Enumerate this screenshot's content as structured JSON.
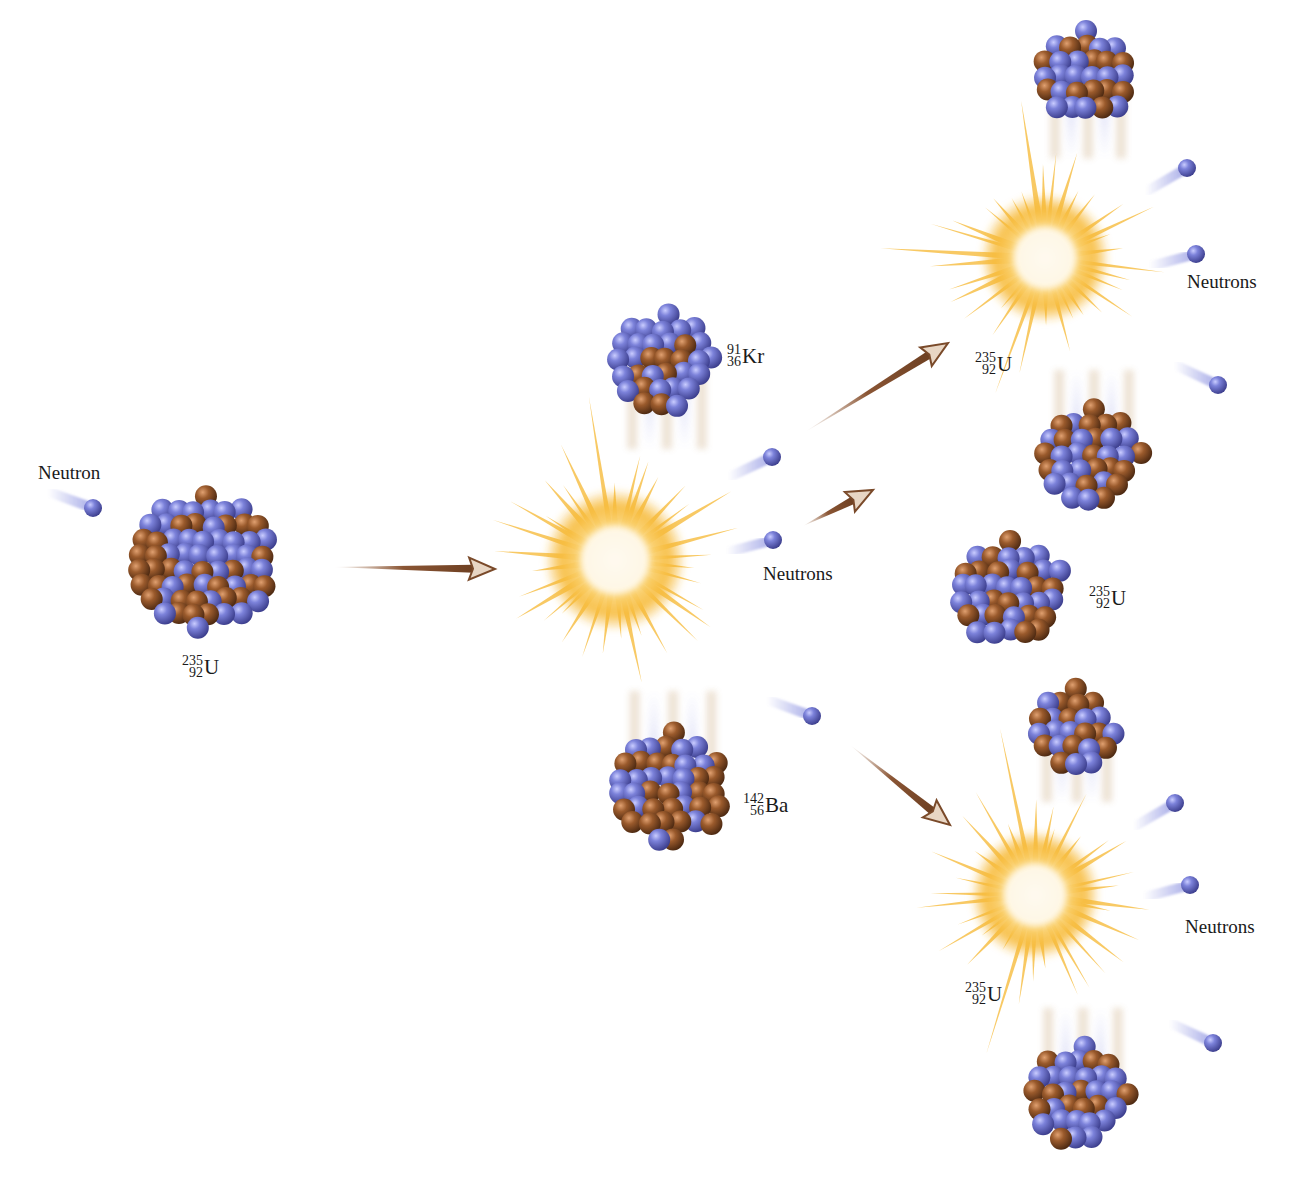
{
  "diagram": {
    "colors": {
      "proton": "#7076d0",
      "neutron_particle": "#a0602e",
      "flash_outer": "#f6b832",
      "flash_inner": "#fff6d8",
      "arrow": "#8a5a3c",
      "text": "#1a1a1a"
    },
    "labels": {
      "incoming_neutron": "Neutron",
      "neutrons_stage1": "Neutrons",
      "neutrons_stage2_top": "Neutrons",
      "neutrons_stage2_bottom": "Neutrons"
    },
    "isotopes": {
      "initial_u": {
        "mass": "235",
        "atomic": "92",
        "symbol": "U"
      },
      "krypton": {
        "mass": "91",
        "atomic": "36",
        "symbol": "Kr"
      },
      "barium": {
        "mass": "142",
        "atomic": "56",
        "symbol": "Ba"
      },
      "top_u": {
        "mass": "235",
        "atomic": "92",
        "symbol": "U"
      },
      "middle_u": {
        "mass": "235",
        "atomic": "92",
        "symbol": "U"
      },
      "bottom_u": {
        "mass": "235",
        "atomic": "92",
        "symbol": "U"
      }
    },
    "nodes": [
      {
        "id": "incoming-neutron",
        "kind": "neutron"
      },
      {
        "id": "initial-u235",
        "kind": "nucleus",
        "isotope": "initial_u"
      },
      {
        "id": "fission-flash-1",
        "kind": "flash"
      },
      {
        "id": "kr-91",
        "kind": "fragment",
        "isotope": "krypton"
      },
      {
        "id": "ba-142",
        "kind": "fragment",
        "isotope": "barium"
      },
      {
        "id": "stage1-neutron-1",
        "kind": "neutron"
      },
      {
        "id": "stage1-neutron-2",
        "kind": "neutron"
      },
      {
        "id": "stage1-neutron-3",
        "kind": "neutron"
      },
      {
        "id": "fission-flash-top",
        "kind": "flash"
      },
      {
        "id": "fission-flash-bottom",
        "kind": "flash"
      },
      {
        "id": "middle-u235",
        "kind": "nucleus",
        "isotope": "middle_u"
      }
    ]
  }
}
